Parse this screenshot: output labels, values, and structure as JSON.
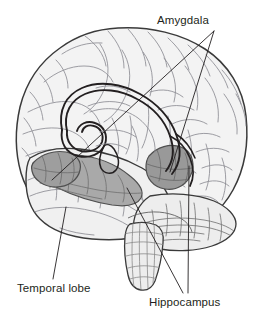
{
  "diagram": {
    "background_color": "#ffffff",
    "line_color": "#231f20",
    "labels": [
      {
        "id": "amygdala",
        "text": "Amygdala",
        "position": "top-right",
        "leader_count": 2
      },
      {
        "id": "temporal-lobe",
        "text": "Temporal lobe",
        "position": "bottom-left",
        "leader_count": 1
      },
      {
        "id": "hippocampus",
        "text": "Hippocampus",
        "position": "bottom-right",
        "leader_count": 2
      }
    ],
    "structures": [
      {
        "id": "cerebrum",
        "name": "cerebral-cortex",
        "fill_color": "#f2f2f2",
        "stroke_color": "#3a3a3a"
      },
      {
        "id": "cerebellum",
        "name": "cerebellum",
        "fill_color": "#ececec",
        "stroke_color": "#4a4a4a"
      },
      {
        "id": "brainstem",
        "name": "brainstem",
        "fill_color": "#ededed",
        "stroke_color": "#4a4a4a"
      },
      {
        "id": "hippocampus-body",
        "name": "hippocampus",
        "fill_color": "#a9a9a9",
        "stroke_color": "#4a4a4a"
      },
      {
        "id": "amygdala-left",
        "name": "amygdala-left",
        "fill_color": "#a0a0a0",
        "stroke_color": "#4a4a4a"
      },
      {
        "id": "amygdala-right",
        "name": "amygdala-right",
        "fill_color": "#9a9a9a",
        "stroke_color": "#4a4a4a"
      },
      {
        "id": "fornix",
        "name": "fornix",
        "fill_color": "none",
        "stroke_color": "#231f20"
      },
      {
        "id": "corpus-callosum",
        "name": "corpus-callosum",
        "fill_color": "#f0f0f0",
        "stroke_color": "#555555"
      }
    ]
  }
}
